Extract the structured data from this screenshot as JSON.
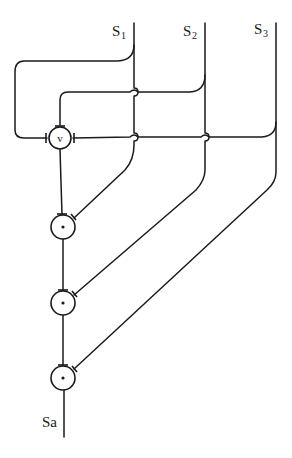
{
  "diagram": {
    "inputs": [
      {
        "label": "S",
        "subscript": "1"
      },
      {
        "label": "S",
        "subscript": "2"
      },
      {
        "label": "S",
        "subscript": "3"
      }
    ],
    "nodes": [
      {
        "id": "or",
        "symbol": "v"
      },
      {
        "id": "and1",
        "symbol": "·"
      },
      {
        "id": "and2",
        "symbol": "·"
      },
      {
        "id": "and3",
        "symbol": "·"
      }
    ],
    "output": {
      "label": "Sa"
    }
  }
}
